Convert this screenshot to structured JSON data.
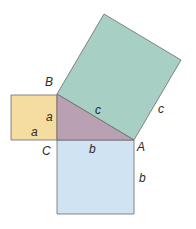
{
  "colors": {
    "square_a": "#f5dca0",
    "square_b": "#cfe3f3",
    "square_c": "#a7cfc4",
    "triangle": "#b9a0b3",
    "stroke": "#6b6b6b"
  },
  "vertices": {
    "A": "A",
    "B": "B",
    "C": "C"
  },
  "sides": {
    "a_left": "a",
    "a_bottom": "a",
    "b_top": "b",
    "b_right": "b",
    "c_hyp": "c",
    "c_outer": "c"
  }
}
